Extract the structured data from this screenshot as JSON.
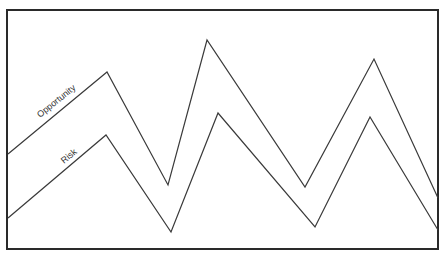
{
  "diagram": {
    "title": "",
    "frame": {
      "x": 7,
      "y": 10,
      "width": 431,
      "height": 239
    },
    "series": [
      {
        "name": "Opportunity",
        "label": "Opportunity",
        "points": [
          [
            8,
            154
          ],
          [
            107,
            72
          ],
          [
            168,
            185
          ],
          [
            207,
            40
          ],
          [
            305,
            187
          ],
          [
            374,
            59
          ],
          [
            438,
            198
          ]
        ],
        "label_pos": {
          "x": 40,
          "y": 118,
          "angle": -39
        }
      },
      {
        "name": "Risk",
        "label": "Risk",
        "points": [
          [
            8,
            218
          ],
          [
            106,
            135
          ],
          [
            171,
            232
          ],
          [
            218,
            113
          ],
          [
            315,
            227
          ],
          [
            370,
            117
          ],
          [
            438,
            230
          ]
        ],
        "label_pos": {
          "x": 64,
          "y": 164,
          "angle": -40
        }
      }
    ],
    "colors": {
      "line": "#3a3a3a",
      "frame": "#2a2a2a",
      "background": "#ffffff"
    }
  }
}
